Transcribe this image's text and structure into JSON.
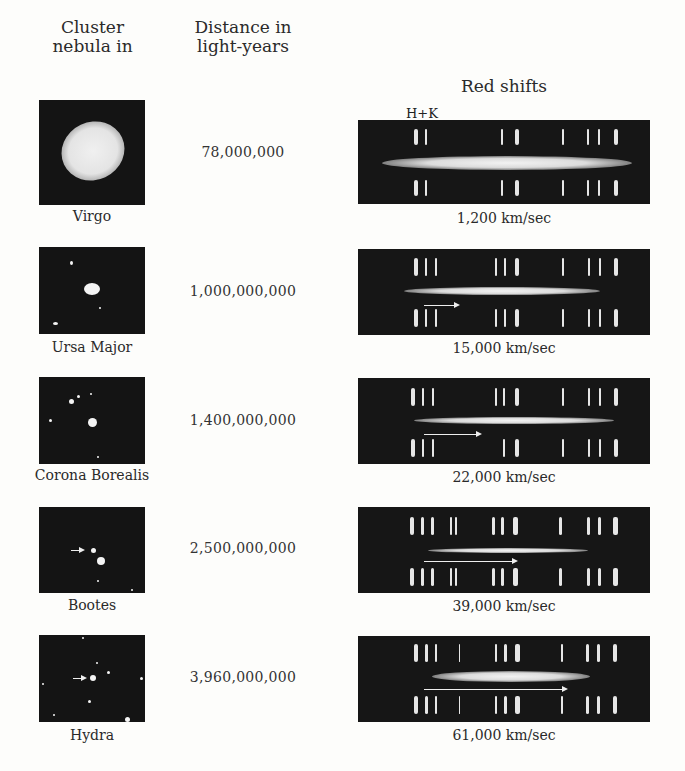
{
  "headers": {
    "cluster": [
      "Cluster",
      "nebula in"
    ],
    "distance": [
      "Distance in",
      "light-years"
    ],
    "redshift": "Red shifts"
  },
  "hk_label": "H+K",
  "rows": [
    {
      "cluster": "Virgo",
      "distance": "78,000,000",
      "velocity": "1,200 km/sec"
    },
    {
      "cluster": "Ursa Major",
      "distance": "1,000,000,000",
      "velocity": "15,000 km/sec"
    },
    {
      "cluster": "Corona Borealis",
      "distance": "1,400,000,000",
      "velocity": "22,000 km/sec"
    },
    {
      "cluster": "Bootes",
      "distance": "2,500,000,000",
      "velocity": "39,000 km/sec"
    },
    {
      "cluster": "Hydra",
      "distance": "3,960,000,000",
      "velocity": "61,000 km/sec"
    }
  ],
  "colors": {
    "background": "#fdfdfb",
    "panel": "#161616",
    "text": "#2a2a2a",
    "emission": "#e6e6e6"
  }
}
